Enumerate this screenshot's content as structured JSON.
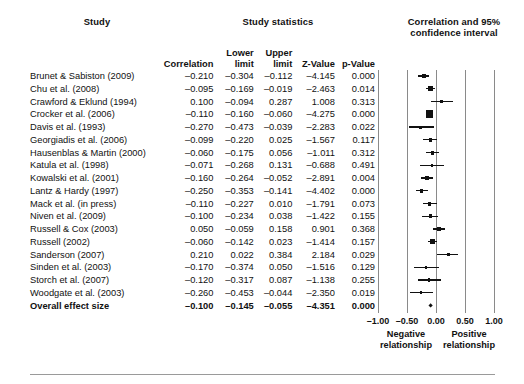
{
  "headers": {
    "study": "Study",
    "study_statistics": "Study statistics",
    "plot_title_line1": "Correlation and 95%",
    "plot_title_line2": "confidence interval"
  },
  "columns": {
    "study": "Study",
    "correlation": "Correlation",
    "lower_limit_l1": "Lower",
    "lower_limit_l2": "limit",
    "upper_limit_l1": "Upper",
    "upper_limit_l2": "limit",
    "z_value": "Z-Value",
    "p_value": "p-Value"
  },
  "axis": {
    "ticks": [
      "–1.00",
      "–0.50",
      "0.00",
      "0.50",
      "1.00"
    ],
    "tick_values": [
      -1.0,
      -0.5,
      0.0,
      0.5,
      1.0
    ],
    "min": -1.0,
    "max": 1.0,
    "caption_negative_l1": "Negative",
    "caption_negative_l2": "relationship",
    "caption_positive_l1": "Positive",
    "caption_positive_l2": "relationship"
  },
  "colors": {
    "marker": "#111111",
    "gridline": "#8a8a8a",
    "text": "#111111",
    "background": "#ffffff"
  },
  "chart_data": {
    "type": "table",
    "title": "Correlation and 95% confidence interval",
    "xlabel": "Correlation",
    "ylabel": "",
    "xlim": [
      -1.0,
      1.0
    ],
    "grid": true,
    "legend": "none",
    "rows": [
      {
        "study": "Brunet & Sabiston (2009)",
        "correlation": "–0.210",
        "lower": "–0.304",
        "upper": "–0.112",
        "z": "–4.145",
        "p": "0.000",
        "r": -0.21,
        "lo": -0.304,
        "hi": -0.112,
        "w": 4.8
      },
      {
        "study": "Chu et al. (2008)",
        "correlation": "–0.095",
        "lower": "–0.169",
        "upper": "–0.019",
        "z": "–2.463",
        "p": "0.014",
        "r": -0.095,
        "lo": -0.169,
        "hi": -0.019,
        "w": 5.4
      },
      {
        "study": "Crawford & Eklund (1994)",
        "correlation": "0.100",
        "lower": "–0.094",
        "upper": "0.287",
        "z": "1.008",
        "p": "0.313",
        "r": 0.1,
        "lo": -0.094,
        "hi": 0.287,
        "w": 3.2
      },
      {
        "study": "Crocker et al. (2006)",
        "correlation": "–0.110",
        "lower": "–0.160",
        "upper": "–0.060",
        "z": "–4.275",
        "p": "0.000",
        "r": -0.11,
        "lo": -0.16,
        "hi": -0.06,
        "w": 7.6
      },
      {
        "study": "Davis et al. (1993)",
        "correlation": "–0.270",
        "lower": "–0.473",
        "upper": "–0.039",
        "z": "–2.283",
        "p": "0.022",
        "r": -0.27,
        "lo": -0.473,
        "hi": -0.039,
        "w": 3.0
      },
      {
        "study": "Georgiadis et al. (2006)",
        "correlation": "–0.099",
        "lower": "–0.220",
        "upper": "0.025",
        "z": "–1.567",
        "p": "0.117",
        "r": -0.099,
        "lo": -0.22,
        "hi": 0.025,
        "w": 4.0
      },
      {
        "study": "Hausenblas & Martin (2000)",
        "correlation": "–0.060",
        "lower": "–0.175",
        "upper": "0.056",
        "z": "–1.011",
        "p": "0.312",
        "r": -0.06,
        "lo": -0.175,
        "hi": 0.056,
        "w": 4.0
      },
      {
        "study": "Katula et al. (1998)",
        "correlation": "–0.071",
        "lower": "–0.268",
        "upper": "0.131",
        "z": "–0.688",
        "p": "0.491",
        "r": -0.071,
        "lo": -0.268,
        "hi": 0.131,
        "w": 3.0
      },
      {
        "study": "Kowalski et al. (2001)",
        "correlation": "–0.160",
        "lower": "–0.264",
        "upper": "–0.052",
        "z": "–2.891",
        "p": "0.004",
        "r": -0.16,
        "lo": -0.264,
        "hi": -0.052,
        "w": 4.5
      },
      {
        "study": "Lantz & Hardy (1997)",
        "correlation": "–0.250",
        "lower": "–0.353",
        "upper": "–0.141",
        "z": "–4.402",
        "p": "0.000",
        "r": -0.25,
        "lo": -0.353,
        "hi": -0.141,
        "w": 4.5
      },
      {
        "study": "Mack et al. (in press)",
        "correlation": "–0.110",
        "lower": "–0.227",
        "upper": "0.010",
        "z": "–1.791",
        "p": "0.073",
        "r": -0.11,
        "lo": -0.227,
        "hi": 0.01,
        "w": 4.0
      },
      {
        "study": "Niven et al. (2009)",
        "correlation": "–0.100",
        "lower": "–0.234",
        "upper": "0.038",
        "z": "–1.422",
        "p": "0.155",
        "r": -0.1,
        "lo": -0.234,
        "hi": 0.038,
        "w": 3.8
      },
      {
        "study": "Russell & Cox (2003)",
        "correlation": "0.050",
        "lower": "–0.059",
        "upper": "0.158",
        "z": "0.901",
        "p": "0.368",
        "r": 0.05,
        "lo": -0.059,
        "hi": 0.158,
        "w": 4.5
      },
      {
        "study": "Russell (2002)",
        "correlation": "–0.060",
        "lower": "–0.142",
        "upper": "0.023",
        "z": "–1.414",
        "p": "0.157",
        "r": -0.06,
        "lo": -0.142,
        "hi": 0.023,
        "w": 5.2
      },
      {
        "study": "Sanderson (2007)",
        "correlation": "0.210",
        "lower": "0.022",
        "upper": "0.384",
        "z": "2.184",
        "p": "0.029",
        "r": 0.21,
        "lo": 0.022,
        "hi": 0.384,
        "w": 3.3
      },
      {
        "study": "Sinden et al. (2003)",
        "correlation": "–0.170",
        "lower": "–0.374",
        "upper": "0.050",
        "z": "–1.516",
        "p": "0.129",
        "r": -0.17,
        "lo": -0.374,
        "hi": 0.05,
        "w": 3.0
      },
      {
        "study": "Storch et al. (2007)",
        "correlation": "–0.120",
        "lower": "–0.317",
        "upper": "0.087",
        "z": "–1.138",
        "p": "0.255",
        "r": -0.12,
        "lo": -0.317,
        "hi": 0.087,
        "w": 3.1
      },
      {
        "study": "Woodgate et al. (2003)",
        "correlation": "–0.260",
        "lower": "–0.453",
        "upper": "–0.044",
        "z": "–2.350",
        "p": "0.019",
        "r": -0.26,
        "lo": -0.453,
        "hi": -0.044,
        "w": 3.0
      }
    ],
    "summary": {
      "study": "Overall effect size",
      "correlation": "–0.100",
      "lower": "–0.145",
      "upper": "–0.055",
      "z": "–4.351",
      "p": "0.000",
      "r": -0.1,
      "lo": -0.145,
      "hi": -0.055
    }
  }
}
